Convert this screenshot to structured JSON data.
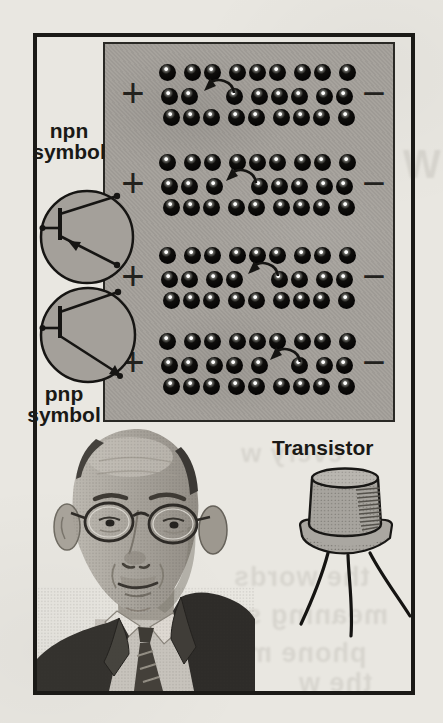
{
  "diagram": {
    "npn_label": {
      "line1": "npn",
      "line2": "symbol"
    },
    "pnp_label": {
      "line1": "pnp",
      "line2": "symbol"
    },
    "polarity_positive": "+",
    "polarity_negative": "−",
    "cols": 9,
    "rows_per_band": 3,
    "bands": [
      {
        "gap_col": 2
      },
      {
        "gap_col": 3
      },
      {
        "gap_col": 4
      },
      {
        "gap_col": 5
      }
    ]
  },
  "transistor": {
    "label": "Transistor"
  },
  "bleed_through": [
    "W",
    "every w",
    "the words",
    "meaning so",
    "phone ma",
    "the w"
  ],
  "colors": {
    "paper": "#e9e7e1",
    "panel_gray": "#a4a09a",
    "ink": "#1a1916",
    "dot": "#0f0e0c"
  }
}
